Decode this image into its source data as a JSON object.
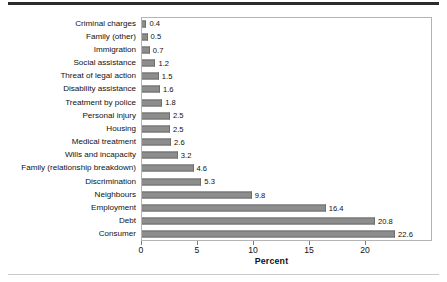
{
  "chart_data": {
    "type": "bar",
    "orientation": "horizontal",
    "title": "",
    "subtitle": "",
    "xlabel": "Percent",
    "ylabel": "",
    "xlim": [
      0,
      23.2
    ],
    "xticks": [
      0,
      5,
      10,
      15,
      20
    ],
    "xtick_labels": [
      "0",
      "5",
      "10",
      "15",
      "20"
    ],
    "grid": false,
    "legend": null,
    "legend_position": "none",
    "bar_color": "#8d8d8d",
    "bar_edge_color": "#6e6e6e",
    "categories": [
      "Criminal charges",
      "Family (other)",
      "Immigration",
      "Social assistance",
      "Threat of legal action",
      "Disability assistance",
      "Treatment by police",
      "Personal injury",
      "Housing",
      "Medical treatment",
      "Wills and incapacity",
      "Family (relationship breakdown)",
      "Discrimination",
      "Neighbours",
      "Employment",
      "Debt",
      "Consumer"
    ],
    "values": [
      0.4,
      0.5,
      0.7,
      1.2,
      1.5,
      1.6,
      1.8,
      2.5,
      2.5,
      2.6,
      3.2,
      4.6,
      5.3,
      9.8,
      16.4,
      20.8,
      22.6
    ],
    "value_labels": [
      "0.4",
      "0.5",
      "0.7",
      "1.2",
      "1.5",
      "1.6",
      "1.8",
      "2.5",
      "2.5",
      "2.6",
      "3.2",
      "4.6",
      "5.3",
      "9.8",
      "16.4",
      "20.8",
      "22.6"
    ]
  }
}
